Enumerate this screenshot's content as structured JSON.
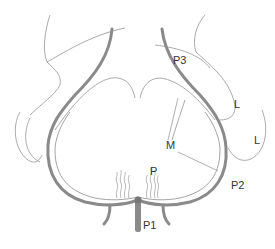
{
  "figure": {
    "labels": {
      "p3": "P3",
      "l_upper": "L",
      "l_right": "L",
      "m": "M",
      "p": "P",
      "p2": "P2",
      "p1": "P1"
    },
    "colors": {
      "membrane": "#8a8a8a",
      "outline": "#9a9a9a",
      "text": "#333333",
      "background": "#ffffff"
    }
  }
}
